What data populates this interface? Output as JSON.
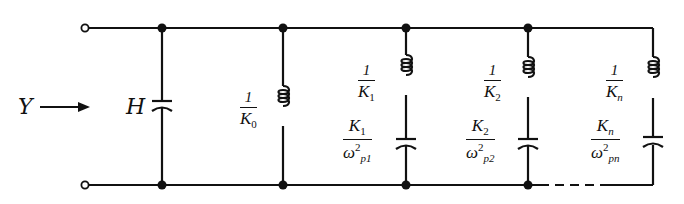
{
  "diagram": {
    "type": "circuit",
    "input_label": "Y",
    "shunt_capacitor_label": "H",
    "branches": [
      {
        "id": "k0",
        "inductor": {
          "num": "1",
          "den": "K",
          "den_sub": "0"
        }
      },
      {
        "id": "k1",
        "inductor": {
          "num": "1",
          "den": "K",
          "den_sub": "1"
        },
        "capacitor": {
          "num": "K",
          "num_sub": "1",
          "den": "ω",
          "den_sup": "2",
          "den_sub": "p1"
        }
      },
      {
        "id": "k2",
        "inductor": {
          "num": "1",
          "den": "K",
          "den_sub": "2"
        },
        "capacitor": {
          "num": "K",
          "num_sub": "2",
          "den": "ω",
          "den_sup": "2",
          "den_sub": "p2"
        }
      },
      {
        "id": "kn",
        "inductor": {
          "num": "1",
          "den": "K",
          "den_sub": "n"
        },
        "capacitor": {
          "num": "K",
          "num_sub": "n",
          "den": "ω",
          "den_sup": "2",
          "den_sub": "pn"
        }
      }
    ],
    "colors": {
      "line": "#111111",
      "background": "#ffffff"
    }
  }
}
